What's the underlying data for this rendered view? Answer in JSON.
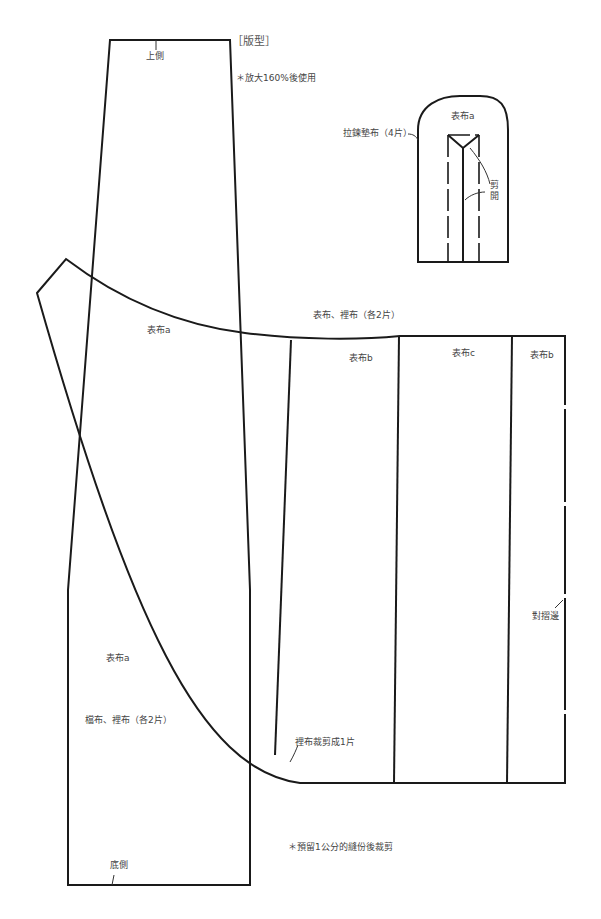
{
  "title": "［版型］",
  "notes": {
    "enlarge": "＊放大160%後使用",
    "seam": "＊預留1公分的縫份後裁剪"
  },
  "labels": {
    "top_side": "上側",
    "bottom_side": "底側",
    "zipper_facing": "拉鍊墊布（4片）",
    "facing_piece": "表布a",
    "cut_open": "剪\n開",
    "cut_1": "剪",
    "cut_2": "開",
    "outer_a_upper": "表布a",
    "outer_lining_each2": "表布、裡布（各2片）",
    "outer_b_left": "表布b",
    "outer_c": "表布c",
    "outer_b_right": "表布b",
    "fold_edge": "對摺邊",
    "outer_a_lower": "表布a",
    "gusset_lining_each2": "檔布、裡布（各2片）",
    "lining_cut_one": "裡布裁剪成1片"
  },
  "colors": {
    "stroke": "#1a1a1a",
    "text": "#444444",
    "background": "#ffffff"
  }
}
